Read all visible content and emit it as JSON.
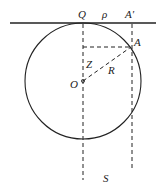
{
  "diagram": {
    "labels": {
      "Q": "Q",
      "rho": "ρ",
      "A_prime": "A′",
      "A": "A",
      "Z": "Z",
      "R": "R",
      "O": "O",
      "S": "S"
    },
    "colors": {
      "stroke": "#222222",
      "background": "#ffffff"
    }
  }
}
